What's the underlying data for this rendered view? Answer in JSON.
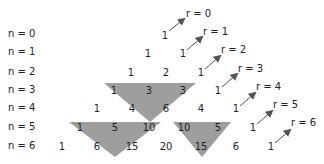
{
  "diagram": {
    "row_labels": [
      "n = 0",
      "n = 1",
      "n = 2",
      "n = 3",
      "n = 4",
      "n = 5",
      "n = 6"
    ],
    "rows": [
      [
        "1"
      ],
      [
        "1",
        "1"
      ],
      [
        "1",
        "2",
        "1"
      ],
      [
        "1",
        "3",
        "3",
        "1"
      ],
      [
        "1",
        "4",
        "6",
        "4",
        "1"
      ],
      [
        "1",
        "5",
        "10",
        "10",
        "5",
        "1"
      ],
      [
        "1",
        "6",
        "15",
        "20",
        "15",
        "6",
        "1"
      ]
    ],
    "r_labels": [
      "r = 0",
      "r = 1",
      "r = 2",
      "r = 3",
      "r = 4",
      "r = 5",
      "r = 6"
    ],
    "highlighted_triangles": [
      {
        "top_left": "1",
        "top_right": "3",
        "bottom": "4",
        "rows": "n=3 to n=4"
      },
      {
        "top_left": "1",
        "top_right": "5",
        "bottom": "6",
        "rows": "n=5 to n=6"
      },
      {
        "top_left": "10",
        "top_right": "5",
        "bottom": "15",
        "rows": "n=5 to n=6"
      }
    ],
    "colors": {
      "triangle_fill": "#9e9e9e",
      "arrow": "#555555",
      "text": "#222222"
    }
  }
}
